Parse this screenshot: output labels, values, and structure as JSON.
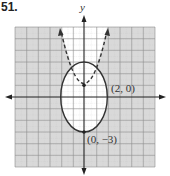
{
  "problem_number": "51.",
  "axes": {
    "x_label": "",
    "y_label": "y"
  },
  "grid": {
    "x_range": [
      -6,
      6
    ],
    "y_range": [
      -6,
      6
    ],
    "step": 1
  },
  "curves": [
    {
      "type": "ellipse",
      "style": "solid",
      "equation": "x^2/4 + y^2/9 = 1",
      "center": [
        0,
        0
      ],
      "rx": 2,
      "ry": 3
    },
    {
      "type": "parabola",
      "style": "dashed",
      "equation": "y = x^2 + 1",
      "vertex": [
        0,
        1
      ]
    }
  ],
  "points": [
    {
      "label": "(2, 0)",
      "x": 2,
      "y": 0
    },
    {
      "label": "(0, −3)",
      "x": 0,
      "y": -3
    },
    {
      "label": "",
      "x": 0,
      "y": 1
    }
  ],
  "colors": {
    "shade": "#d9d9d9",
    "grid": "#9a9a9a",
    "curve": "#333333",
    "axis": "#222222"
  }
}
